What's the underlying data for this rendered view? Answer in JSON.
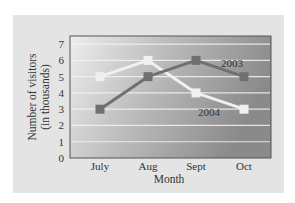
{
  "chart_data": {
    "type": "line",
    "title": "",
    "xlabel": "Month",
    "ylabel": "Number of visitors (in thousands)",
    "ylabel_lines": [
      "Number of visitors",
      "(in thousands)"
    ],
    "categories": [
      "July",
      "Aug",
      "Sept",
      "Oct"
    ],
    "yticks": [
      "0",
      "1",
      "2",
      "3",
      "4",
      "5",
      "6",
      "7"
    ],
    "ylim": [
      0,
      7.5
    ],
    "grid": true,
    "legend": "inline labels",
    "series": [
      {
        "name": "2003",
        "values": [
          3,
          5,
          6,
          5
        ],
        "color": "#707070"
      },
      {
        "name": "2004",
        "values": [
          5,
          6,
          4,
          3
        ],
        "color": "#f0f0f0"
      }
    ]
  },
  "colors": {
    "panel": "#e4e4e4",
    "plot_light": "#ededed",
    "plot_dark": "#8f8f8f",
    "gridline": "#f4f4f4"
  }
}
